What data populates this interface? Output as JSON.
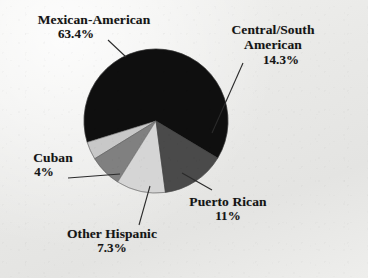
{
  "figure": {
    "background_color": "#ebebeb",
    "type": "pie-chart-figure"
  },
  "chart_data": {
    "type": "pie",
    "title": "",
    "subtitle": "",
    "xlabel": "",
    "ylabel": "",
    "legend_position": "none",
    "grid": false,
    "labels_placement": "outside-with-leader-lines",
    "categories": [
      "Mexican-American",
      "Central/South American",
      "Puerto Rican",
      "Other Hispanic",
      "Cuban"
    ],
    "values": [
      63.4,
      14.3,
      11,
      7.3,
      4
    ],
    "value_labels": [
      "63.4%",
      "14.3%",
      "11%",
      "7.3%",
      "4%"
    ],
    "units": "percent",
    "total": 100,
    "colors": [
      "#0f0f0f",
      "#4a4a4a",
      "#d5d5d5",
      "#808080",
      "#c8c8c8"
    ],
    "slices": [
      {
        "label": "Mexican-American",
        "value": 63.4,
        "value_label": "63.4%",
        "color": "#0f0f0f"
      },
      {
        "label": "Central/South American",
        "value": 14.3,
        "value_label": "14.3%",
        "color": "#4a4a4a"
      },
      {
        "label": "Puerto Rican",
        "value": 11,
        "value_label": "11%",
        "color": "#d5d5d5"
      },
      {
        "label": "Other Hispanic",
        "value": 7.3,
        "value_label": "7.3%",
        "color": "#808080"
      },
      {
        "label": "Cuban",
        "value": 4,
        "value_label": "4%",
        "color": "#c8c8c8"
      }
    ]
  },
  "labels": {
    "mexican_american": {
      "name": "Mexican-American",
      "pct": "63.4%"
    },
    "central_south_american": {
      "name_line1": "Central/South",
      "name_line2": "American",
      "pct": "14.3%"
    },
    "puerto_rican": {
      "name": "Puerto Rican",
      "pct": "11%"
    },
    "other_hispanic": {
      "name": "Other Hispanic",
      "pct": "7.3%"
    },
    "cuban": {
      "name": "Cuban",
      "pct": "4%"
    }
  }
}
